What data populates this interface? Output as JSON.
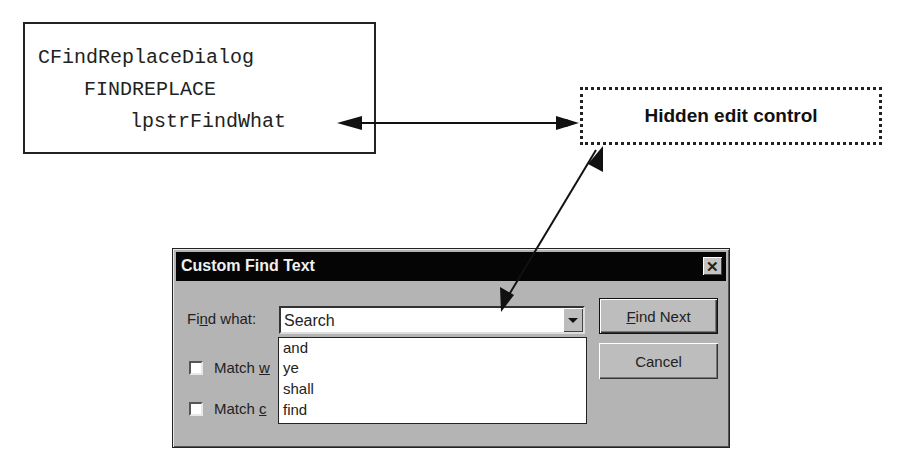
{
  "diagram": {
    "code_box": {
      "lines": [
        "CFindReplaceDialog",
        "FINDREPLACE",
        "lpstrFindWhat"
      ]
    },
    "hidden_box": {
      "label": "Hidden edit control"
    },
    "arrows": [
      {
        "from": "lpstrFindWhat",
        "to": "Hidden edit control",
        "style": "double-headed"
      },
      {
        "from": "Hidden edit control",
        "to": "Find what combo edit field",
        "style": "double-headed"
      }
    ]
  },
  "dialog": {
    "title": "Custom Find Text",
    "close_glyph": "✕",
    "find_label_pre": "Fi",
    "find_label_u": "n",
    "find_label_post": "d what:",
    "combo_value": "Search",
    "dropdown_items": [
      "and",
      "ye",
      "shall",
      "find"
    ],
    "checkbox_1": {
      "pre": "Match ",
      "u": "w",
      "checked": false
    },
    "checkbox_2": {
      "pre": "Match ",
      "u": "c",
      "checked": false
    },
    "buttons": {
      "find_next_u": "F",
      "find_next_rest": "ind Next",
      "cancel": "Cancel"
    }
  }
}
